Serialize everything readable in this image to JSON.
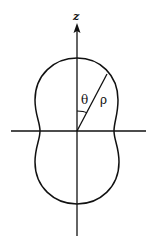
{
  "diagram": {
    "labels": {
      "axis_z": "z",
      "angle": "θ",
      "radius": "ρ"
    },
    "colors": {
      "stroke": "#111111",
      "background": "#ffffff"
    }
  }
}
